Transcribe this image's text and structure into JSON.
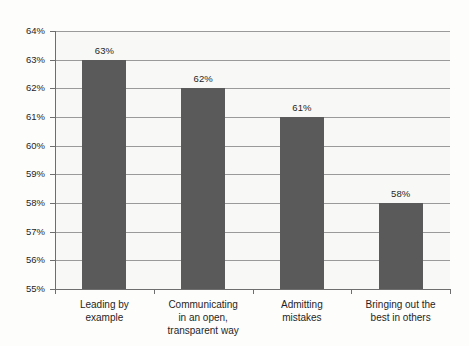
{
  "chart_data": {
    "type": "bar",
    "title": "",
    "xlabel": "",
    "ylabel": "",
    "ylim": [
      55,
      64
    ],
    "ytick_step": 1,
    "ytick_labels": [
      "64%",
      "63%",
      "62%",
      "61%",
      "60%",
      "59%",
      "58%",
      "57%",
      "56%",
      "55%"
    ],
    "ytick_values": [
      64,
      63,
      62,
      61,
      60,
      59,
      58,
      57,
      56,
      55
    ],
    "grid": true,
    "legend": false,
    "categories": [
      "Leading by example",
      "Communicating in an open, transparent way",
      "Admitting mistakes",
      "Bringing out the best in others"
    ],
    "category_lines": [
      [
        "Leading by",
        "example"
      ],
      [
        "Communicating",
        "in an open,",
        "transparent way"
      ],
      [
        "Admitting",
        "mistakes"
      ],
      [
        "Bringing out the",
        "best in others"
      ]
    ],
    "values": [
      63,
      62,
      61,
      58
    ],
    "value_labels": [
      "63%",
      "62%",
      "61%",
      "58%"
    ],
    "colors": {
      "bar_fill": "#5a5a5a",
      "gridline": "#9a9a9a",
      "axis": "#6e6e6e",
      "plot_background": "#f8f8f6",
      "text": "#1f1f1f"
    }
  }
}
